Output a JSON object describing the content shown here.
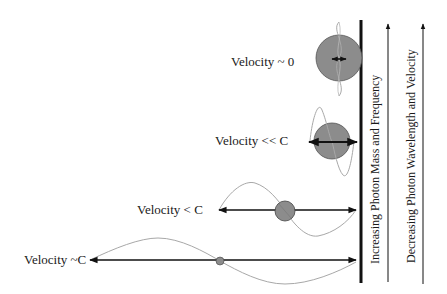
{
  "diagram": {
    "rows": [
      {
        "label": "Velocity ~ 0"
      },
      {
        "label": "Velocity << C"
      },
      {
        "label": "Velocity < C"
      },
      {
        "label": "Velocity ~C"
      }
    ],
    "axis_labels": {
      "mass_frequency": "Increasing Photon Mass and Frequency",
      "wavelength_velocity": "Decreasing Photon Wavelength and Velocity"
    },
    "colors": {
      "particle_fill": "#8c8c8c",
      "wave_stroke": "#a8a8a8",
      "line": "#111111"
    }
  }
}
